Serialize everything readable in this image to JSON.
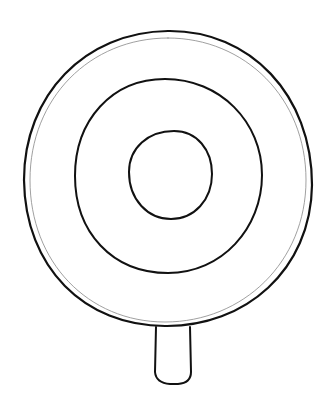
{
  "drawing": {
    "subject": "lollipop-outline",
    "stroke_color": "#111111",
    "thin_stroke_color": "#888888",
    "background": "#ffffff"
  }
}
